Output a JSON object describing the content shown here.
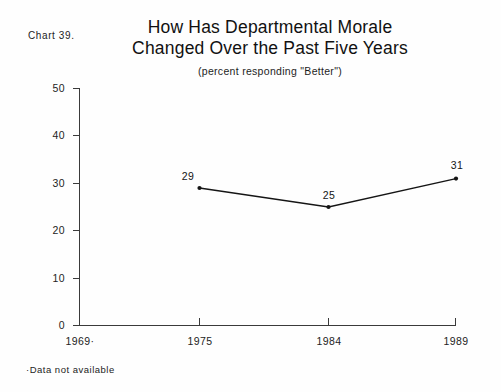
{
  "chart_number": "Chart 39.",
  "title_lines": [
    "How Has Departmental Morale",
    "Changed Over the Past Five Years"
  ],
  "subtitle": "(percent responding \"Better\")",
  "footnote": "·Data not available",
  "chart_data": {
    "type": "line",
    "title": "How Has Departmental Morale Changed Over the Past Five Years",
    "subtitle": "(percent responding \"Better\")",
    "xlabel": "",
    "ylabel": "",
    "categories": [
      "1969·",
      "1975",
      "1984",
      "1989"
    ],
    "values": [
      null,
      29,
      25,
      31
    ],
    "point_labels": [
      "",
      "29",
      "25",
      "31"
    ],
    "ylim": [
      0,
      50
    ],
    "yticks": [
      0,
      10,
      20,
      30,
      40,
      50
    ],
    "ytick_labels": [
      "0",
      "10",
      "20",
      "30",
      "40",
      "50"
    ],
    "xtick_labels": [
      "1969·",
      "1975",
      "1984",
      "1989"
    ],
    "grid": false,
    "legend": false,
    "series": [
      {
        "name": "percent responding Better",
        "values": [
          null,
          29,
          25,
          31
        ]
      }
    ],
    "annotations": [
      "·Data not available"
    ],
    "line_color": "#151515",
    "marker": "dot"
  }
}
